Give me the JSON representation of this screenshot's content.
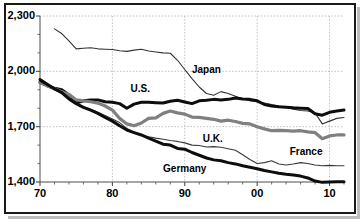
{
  "chart_data": {
    "type": "line",
    "title": "",
    "subtitle": "",
    "xlabel": "",
    "ylabel": "",
    "xlim": [
      70,
      112
    ],
    "ylim": [
      1400,
      2300
    ],
    "grid": true,
    "grid_style": "dashed-vertical-and-horizontal",
    "legend_position": "inline-annotations",
    "y_ticks": [
      1400,
      1700,
      2000,
      2300
    ],
    "y_tick_labels": [
      "1,400",
      "1,700",
      "2,000",
      "2,300"
    ],
    "y_minor_tick_interval": 100,
    "x_ticks": [
      70,
      80,
      90,
      100,
      110
    ],
    "x_tick_labels": [
      "70",
      "80",
      "90",
      "00",
      "10"
    ],
    "x_minor_tick_interval": 2,
    "series": [
      {
        "name": "Japan",
        "color": "#333333",
        "width": 1.1,
        "x": [
          72,
          73,
          74,
          75,
          76,
          77,
          78,
          79,
          80,
          81,
          82,
          83,
          84,
          85,
          86,
          87,
          88,
          89,
          90,
          91,
          92,
          93,
          94,
          95,
          96,
          97,
          98,
          99,
          100,
          101,
          102,
          103,
          104,
          105,
          106,
          107,
          108,
          109,
          110,
          111,
          112
        ],
        "values": [
          2230,
          2205,
          2165,
          2122,
          2125,
          2128,
          2122,
          2120,
          2118,
          2112,
          2108,
          2115,
          2120,
          2110,
          2105,
          2100,
          2098,
          2060,
          2010,
          1960,
          1915,
          1880,
          1870,
          1890,
          1880,
          1865,
          1850,
          1840,
          1835,
          1828,
          1820,
          1812,
          1805,
          1795,
          1788,
          1785,
          1775,
          1715,
          1730,
          1745,
          1750
        ]
      },
      {
        "name": "U.S.",
        "color": "#0d0d0d",
        "width": 3.0,
        "x": [
          70,
          71,
          72,
          73,
          74,
          75,
          76,
          77,
          78,
          79,
          80,
          81,
          82,
          83,
          84,
          85,
          86,
          87,
          88,
          89,
          90,
          91,
          92,
          93,
          94,
          95,
          96,
          97,
          98,
          99,
          100,
          101,
          102,
          103,
          104,
          105,
          106,
          107,
          108,
          109,
          110,
          111,
          112
        ],
        "values": [
          1940,
          1922,
          1908,
          1900,
          1872,
          1828,
          1840,
          1845,
          1845,
          1835,
          1832,
          1825,
          1800,
          1822,
          1832,
          1832,
          1830,
          1828,
          1838,
          1843,
          1834,
          1825,
          1840,
          1843,
          1848,
          1845,
          1848,
          1855,
          1850,
          1848,
          1840,
          1820,
          1812,
          1808,
          1805,
          1802,
          1800,
          1798,
          1770,
          1762,
          1778,
          1785,
          1790
        ]
      },
      {
        "name": "U.K.",
        "color": "#808080",
        "width": 3.2,
        "x": [
          70,
          71,
          72,
          73,
          74,
          75,
          76,
          77,
          78,
          79,
          80,
          81,
          82,
          83,
          84,
          85,
          86,
          87,
          88,
          89,
          90,
          91,
          92,
          93,
          94,
          95,
          96,
          97,
          98,
          99,
          100,
          101,
          102,
          103,
          104,
          105,
          106,
          107,
          108,
          109,
          110,
          111,
          112
        ],
        "values": [
          1940,
          1922,
          1905,
          1890,
          1875,
          1845,
          1840,
          1835,
          1828,
          1812,
          1790,
          1745,
          1715,
          1705,
          1720,
          1745,
          1748,
          1772,
          1785,
          1775,
          1768,
          1752,
          1750,
          1745,
          1740,
          1730,
          1735,
          1728,
          1718,
          1715,
          1700,
          1688,
          1678,
          1680,
          1678,
          1676,
          1678,
          1672,
          1668,
          1635,
          1650,
          1655,
          1655
        ]
      },
      {
        "name": "France",
        "color": "#3a3a3a",
        "width": 1.1,
        "x": [
          70,
          71,
          72,
          73,
          74,
          75,
          76,
          77,
          78,
          79,
          80,
          81,
          82,
          83,
          84,
          85,
          86,
          87,
          88,
          89,
          90,
          91,
          92,
          93,
          94,
          95,
          96,
          97,
          98,
          99,
          100,
          101,
          102,
          103,
          104,
          105,
          106,
          107,
          108,
          109,
          110,
          111,
          112
        ],
        "values": [
          1945,
          1925,
          1900,
          1888,
          1860,
          1825,
          1808,
          1795,
          1778,
          1760,
          1742,
          1722,
          1690,
          1668,
          1655,
          1645,
          1638,
          1632,
          1625,
          1620,
          1612,
          1600,
          1598,
          1590,
          1592,
          1588,
          1580,
          1572,
          1548,
          1522,
          1500,
          1505,
          1515,
          1498,
          1492,
          1498,
          1505,
          1500,
          1492,
          1488,
          1490,
          1488,
          1488
        ]
      },
      {
        "name": "Germany",
        "color": "#0d0d0d",
        "width": 3.0,
        "x": [
          70,
          71,
          72,
          73,
          74,
          75,
          76,
          77,
          78,
          79,
          80,
          81,
          82,
          83,
          84,
          85,
          86,
          87,
          88,
          89,
          90,
          91,
          92,
          93,
          94,
          95,
          96,
          97,
          98,
          99,
          100,
          101,
          102,
          103,
          104,
          105,
          106,
          107,
          108,
          109,
          110,
          111,
          112
        ],
        "values": [
          1955,
          1930,
          1905,
          1885,
          1850,
          1825,
          1805,
          1790,
          1772,
          1750,
          1730,
          1705,
          1682,
          1668,
          1655,
          1638,
          1622,
          1605,
          1600,
          1582,
          1578,
          1560,
          1545,
          1530,
          1520,
          1515,
          1505,
          1498,
          1488,
          1480,
          1472,
          1462,
          1455,
          1448,
          1442,
          1438,
          1432,
          1422,
          1405,
          1398,
          1400,
          1402,
          1402
        ]
      }
    ],
    "annotations": [
      {
        "text": "Japan",
        "x": 91,
        "y": 2005
      },
      {
        "text": "U.S.",
        "x": 82.5,
        "y": 1905
      },
      {
        "text": "U.K.",
        "x": 92.5,
        "y": 1635
      },
      {
        "text": "France",
        "x": 104.5,
        "y": 1560
      },
      {
        "text": "Germany",
        "x": 87,
        "y": 1468
      }
    ]
  },
  "style": {
    "frame_color": "#1a1a1a",
    "grid_color": "#b5b5b5",
    "axis_color": "#4d4d4d",
    "background": "#ffffff",
    "shadow_color": "#bdbdbd"
  }
}
